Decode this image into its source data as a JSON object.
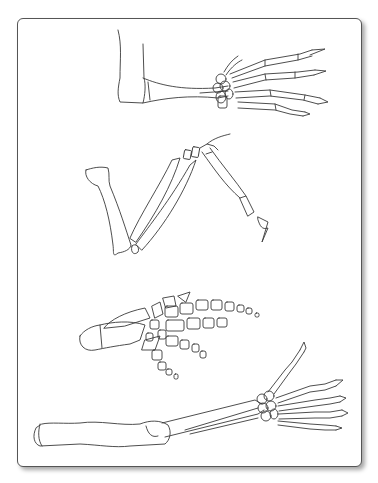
{
  "figure": {
    "type": "line-art illustration",
    "panels": [
      {
        "id": "limb-1",
        "description": "forearm and hand skeleton with five digits (top)"
      },
      {
        "id": "limb-2",
        "description": "bent wing/forelimb with elongated bones and claw (upper middle)"
      },
      {
        "id": "limb-3",
        "description": "paddle/flipper with many rounded phalanges (lower middle)"
      },
      {
        "id": "limb-4",
        "description": "long arm skeleton with humerus, radius/ulna, wrist and five fingers (bottom)"
      }
    ],
    "colors": {
      "line": "#3a3a3a",
      "frame_border": "#555555",
      "background": "#ffffff"
    }
  }
}
